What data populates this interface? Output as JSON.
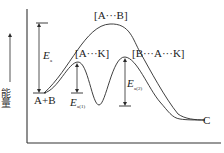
{
  "diagram": {
    "type": "reaction-energy-profile",
    "y_axis_label": "能量",
    "y_axis_direction": "up",
    "reactants_label": "A+B",
    "product_label": "C",
    "uncatalyzed": {
      "transition_state_label": "[A···B]",
      "activation_energy_label": "E",
      "activation_energy_subscript": "a"
    },
    "catalyzed": {
      "transition_state_1_label": "[A···K]",
      "transition_state_2_label": "[B···A···K]",
      "activation_energy_1_label": "E",
      "activation_energy_1_subscript": "a(1)",
      "activation_energy_2_label": "E",
      "activation_energy_2_subscript": "a(2)"
    },
    "colors": {
      "line": "#2a2a2a",
      "background": "#ffffff"
    }
  }
}
